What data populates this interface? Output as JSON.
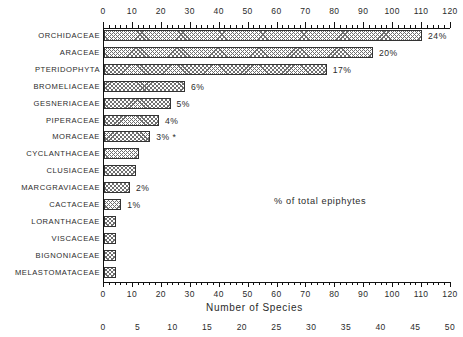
{
  "chart_data": {
    "type": "bar",
    "orientation": "horizontal",
    "title": "",
    "xlabel": "Number of Species",
    "ylabel": "",
    "xlim": [
      0,
      120
    ],
    "grid": false,
    "legend": null,
    "annotation": "% of total epiphytes",
    "footnote_marker": "*",
    "categories": [
      "ORCHIDACEAE",
      "ARACEAE",
      "PTERIDOPHYTA",
      "BROMELIACEAE",
      "GESNERIACEAE",
      "PIPERACEAE",
      "MORACEAE",
      "CYCLANTHACEAE",
      "CLUSIACEAE",
      "MARCGRAVIACEAE",
      "CACTACEAE",
      "LORANTHACEAE",
      "VISCACEAE",
      "BIGNONIACEAE",
      "MELASTOMATACEAE"
    ],
    "values": [
      110,
      93,
      77,
      28,
      23,
      19,
      16,
      12,
      11,
      9,
      6,
      4,
      4,
      4,
      4
    ],
    "percent_labels": [
      "24%",
      "20%",
      "17%",
      "6%",
      "5%",
      "4%",
      "3% *",
      "",
      "",
      "2%",
      "1%",
      "",
      "",
      "",
      ""
    ],
    "axes": {
      "top": {
        "label": "Number of Species",
        "min": 0,
        "max": 120,
        "major_step": 10,
        "minor_step": 2,
        "ticks": [
          0,
          10,
          20,
          30,
          40,
          50,
          60,
          70,
          80,
          90,
          100,
          110,
          120
        ]
      },
      "bottom_species": {
        "min": 0,
        "max": 120,
        "major_step": 10,
        "minor_step": 2,
        "ticks": [
          0,
          10,
          20,
          30,
          40,
          50,
          60,
          70,
          80,
          90,
          100,
          110,
          120
        ]
      },
      "bottom_percent": {
        "min": 0,
        "max": 50,
        "major_step": 5,
        "ticks": [
          0,
          5,
          10,
          15,
          20,
          25,
          30,
          35,
          40,
          45,
          50
        ]
      }
    },
    "colors": {
      "background": "#ffffff",
      "axis": "#111111",
      "text": "#2b2b2b",
      "bar_fill": "#ffffff",
      "bar_hatch": "#6f6f6f",
      "bar_edge": "#333333"
    }
  }
}
